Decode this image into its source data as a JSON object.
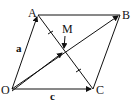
{
  "diagram": {
    "type": "parallelogram-vectors",
    "points": {
      "O": {
        "label": "O",
        "x": 12,
        "y": 89
      },
      "A": {
        "label": "A",
        "x": 38,
        "y": 15
      },
      "B": {
        "label": "B",
        "x": 120,
        "y": 15
      },
      "C": {
        "label": "C",
        "x": 93,
        "y": 89
      },
      "M": {
        "label": "M",
        "x": 64,
        "y": 51
      }
    },
    "vector_labels": {
      "OA": "a",
      "OC": "c"
    },
    "stroke_color": "#111111",
    "background": "#ffffff"
  }
}
